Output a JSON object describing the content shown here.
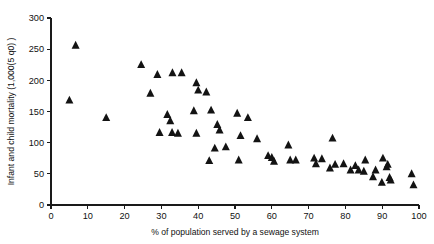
{
  "chart_data": {
    "type": "scatter",
    "title": "",
    "xlabel": "% of population served by a sewage system",
    "ylabel": "Infant and child mortality (1,000(5 q0) )",
    "xlim": [
      0,
      100
    ],
    "ylim": [
      0,
      300
    ],
    "xticks": [
      0,
      10,
      20,
      30,
      40,
      50,
      60,
      70,
      80,
      90,
      100
    ],
    "yticks": [
      0,
      50,
      100,
      150,
      200,
      250,
      300
    ],
    "xticklabels": [
      "0",
      "10",
      "20",
      "30",
      "40",
      "50",
      "60",
      "70",
      "80",
      "90",
      "100"
    ],
    "yticklabels": [
      "0",
      "50",
      "100",
      "150",
      "200",
      "250",
      "300"
    ],
    "grid": false,
    "legend": null,
    "marker": "triangle-up",
    "marker_color": "#131313",
    "marker_size": 5,
    "series": [
      {
        "name": "countries",
        "points": [
          [
            6.7,
            256
          ],
          [
            5.0,
            168
          ],
          [
            15.0,
            140
          ],
          [
            24.5,
            225
          ],
          [
            28.9,
            209
          ],
          [
            27.0,
            179
          ],
          [
            33.0,
            212
          ],
          [
            35.5,
            212
          ],
          [
            39.5,
            196
          ],
          [
            40.0,
            184
          ],
          [
            42.2,
            181
          ],
          [
            38.8,
            151
          ],
          [
            43.5,
            152
          ],
          [
            31.6,
            145
          ],
          [
            32.4,
            135
          ],
          [
            29.5,
            116
          ],
          [
            32.9,
            116
          ],
          [
            34.5,
            115
          ],
          [
            45.2,
            129
          ],
          [
            39.5,
            115
          ],
          [
            45.8,
            120
          ],
          [
            50.6,
            147
          ],
          [
            53.5,
            140
          ],
          [
            51.5,
            111
          ],
          [
            56.0,
            106
          ],
          [
            44.5,
            91
          ],
          [
            47.5,
            93
          ],
          [
            43.0,
            71
          ],
          [
            51.0,
            72
          ],
          [
            59.0,
            79
          ],
          [
            60.0,
            76
          ],
          [
            60.6,
            70
          ],
          [
            64.5,
            96
          ],
          [
            65.0,
            72
          ],
          [
            66.5,
            72
          ],
          [
            72.0,
            66
          ],
          [
            71.5,
            75
          ],
          [
            73.6,
            74
          ],
          [
            76.5,
            107
          ],
          [
            77.2,
            65
          ],
          [
            79.5,
            66
          ],
          [
            75.8,
            59
          ],
          [
            81.4,
            56
          ],
          [
            82.7,
            63
          ],
          [
            83.6,
            56
          ],
          [
            85.4,
            72
          ],
          [
            88.2,
            56
          ],
          [
            90.2,
            75
          ],
          [
            91.2,
            61
          ],
          [
            91.5,
            65
          ],
          [
            92.0,
            44
          ],
          [
            92.3,
            40
          ],
          [
            89.9,
            36
          ],
          [
            98.0,
            50
          ],
          [
            98.5,
            32
          ],
          [
            87.5,
            45
          ],
          [
            85.0,
            54
          ]
        ]
      }
    ]
  },
  "layout": {
    "plot_left": 51,
    "plot_right": 419,
    "plot_top": 18,
    "plot_bottom": 205
  }
}
